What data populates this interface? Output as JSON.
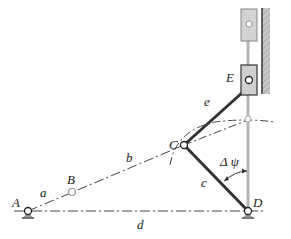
{
  "diagram": {
    "type": "linkage mechanism (four-bar with slider)",
    "points": {
      "A": {
        "label": "A",
        "x": 28,
        "y": 211
      },
      "B": {
        "label": "B",
        "x": 72,
        "y": 192
      },
      "C": {
        "label": "C",
        "x": 184,
        "y": 145
      },
      "D": {
        "label": "D",
        "x": 248,
        "y": 211
      },
      "E": {
        "label": "E",
        "x": 248,
        "y": 79
      }
    },
    "links": {
      "a": "a",
      "b": "b",
      "c": "c",
      "d": "d",
      "e": "e"
    },
    "angle_label": "Δ ψ",
    "colors": {
      "link": "#333333",
      "guide": "#b0b0b0",
      "slider": "#cfcfcf",
      "wall": "#9a9a9a",
      "centerline": "#444444"
    }
  }
}
